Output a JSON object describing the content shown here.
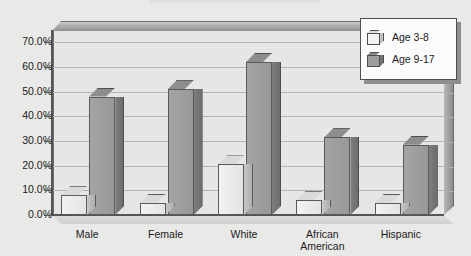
{
  "chart_data": {
    "type": "bar",
    "title": "",
    "xlabel": "",
    "ylabel": "",
    "ylim": [
      0,
      75
    ],
    "grid": true,
    "legend_position": "top-right",
    "categories": [
      "Male",
      "Female",
      "White",
      "African American",
      "Hispanic"
    ],
    "category_lines": [
      [
        "Male"
      ],
      [
        "Female"
      ],
      [
        "White"
      ],
      [
        "African",
        "American"
      ],
      [
        "Hispanic"
      ]
    ],
    "y_ticks": [
      "0.0%",
      "10.0%",
      "20.0%",
      "30.0%",
      "40.0%",
      "50.0%",
      "60.0%",
      "70.0%"
    ],
    "y_tick_values": [
      0,
      10,
      20,
      30,
      40,
      50,
      60,
      70
    ],
    "series": [
      {
        "name": "Age 3-8",
        "color": "#efefed",
        "values": [
          8.0,
          5.0,
          20.5,
          6.0,
          5.0
        ]
      },
      {
        "name": "Age 9-17",
        "color": "#9a9a98",
        "values": [
          48.0,
          51.0,
          62.0,
          31.5,
          28.5
        ]
      }
    ]
  },
  "legend": {
    "items": [
      {
        "label": "Age 3-8",
        "swatch": "cube-light-icon"
      },
      {
        "label": "Age 9-17",
        "swatch": "cube-dark-icon"
      }
    ]
  },
  "colors": {
    "page_background": "#e9e9e7",
    "plot_background": "#e6e6e4",
    "gridline": "#b4b4b2",
    "axis": "#555555",
    "series_light": "#efefed",
    "series_dark": "#9a9a98",
    "legend_background": "#fbfbfb",
    "text": "#1b1b1b"
  }
}
